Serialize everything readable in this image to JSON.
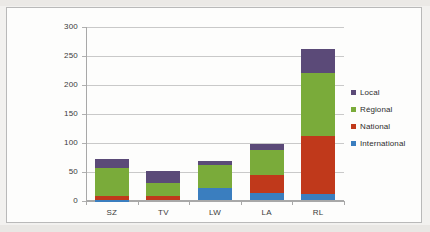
{
  "chart_data": {
    "type": "bar",
    "subtype": "stacked-column",
    "title": "",
    "xlabel": "",
    "ylabel": "",
    "categories": [
      "SZ",
      "TV",
      "LW",
      "LA",
      "RL"
    ],
    "series": [
      {
        "name": "International",
        "color": "#3a7ebf",
        "values": [
          1,
          0,
          22,
          13,
          11
        ]
      },
      {
        "name": "National",
        "color": "#c0391b",
        "values": [
          7,
          7,
          0,
          31,
          100
        ]
      },
      {
        "name": "Régional",
        "color": "#7aab3a",
        "values": [
          49,
          23,
          40,
          43,
          109
        ]
      },
      {
        "name": "Local",
        "color": "#5b4a78",
        "values": [
          15,
          21,
          6,
          11,
          42
        ]
      }
    ],
    "totals": [
      72,
      51,
      68,
      98,
      262
    ],
    "ylim": [
      0,
      300
    ],
    "yticks": [
      0,
      50,
      100,
      150,
      200,
      250,
      300
    ],
    "ytick_labels": [
      "0",
      "50",
      "100",
      "150",
      "200",
      "250",
      "300"
    ],
    "grid": true,
    "legend_position": "right",
    "legend_order": [
      "Local",
      "Régional",
      "National",
      "International"
    ]
  },
  "colors": {
    "international": "#3a7ebf",
    "national": "#c0391b",
    "regional": "#7aab3a",
    "local": "#5b4a78",
    "gridline": "#c9c9c9",
    "axis": "#a8a8a8",
    "plot_background": "#fdfdfc",
    "page_background": "#f2f1ef",
    "text": "#3a3a3a"
  }
}
